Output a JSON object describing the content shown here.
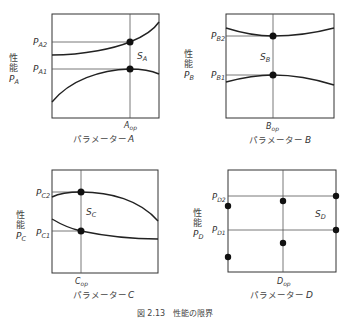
{
  "figure": {
    "caption": "図 2.13　性能の限界",
    "panels": [
      {
        "id": "A",
        "y_axis_label": "性能",
        "y_axis_symbol": "P",
        "y_axis_sub": "A",
        "x_axis_label": "パラメーター",
        "x_axis_letter": "A",
        "op_label": "A",
        "op_sub": "op",
        "levels": [
          {
            "label": "P",
            "sub": "A2"
          },
          {
            "label": "P",
            "sub": "A1"
          }
        ],
        "region_label": "S",
        "region_sub": "A"
      },
      {
        "id": "B",
        "y_axis_label": "性能",
        "y_axis_symbol": "P",
        "y_axis_sub": "B",
        "x_axis_label": "パラメーター",
        "x_axis_letter": "B",
        "op_label": "B",
        "op_sub": "op",
        "levels": [
          {
            "label": "P",
            "sub": "B2"
          },
          {
            "label": "P",
            "sub": "B1"
          }
        ],
        "region_label": "S",
        "region_sub": "B"
      },
      {
        "id": "C",
        "y_axis_label": "性能",
        "y_axis_symbol": "P",
        "y_axis_sub": "C",
        "x_axis_label": "パラメーター",
        "x_axis_letter": "C",
        "op_label": "C",
        "op_sub": "op",
        "levels": [
          {
            "label": "P",
            "sub": "C2"
          },
          {
            "label": "P",
            "sub": "C1"
          }
        ],
        "region_label": "S",
        "region_sub": "C"
      },
      {
        "id": "D",
        "y_axis_label": "性能",
        "y_axis_symbol": "P",
        "y_axis_sub": "D",
        "x_axis_label": "パラメーター",
        "x_axis_letter": "D",
        "op_label": "D",
        "op_sub": "op",
        "levels": [
          {
            "label": "P",
            "sub": "D2"
          },
          {
            "label": "P",
            "sub": "D1"
          }
        ],
        "region_label": "S",
        "region_sub": "D"
      }
    ]
  }
}
